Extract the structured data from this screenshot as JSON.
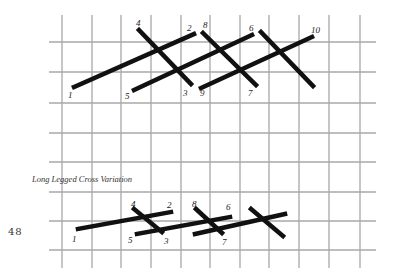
{
  "page_number": "48",
  "caption": "Long Legged Cross Variation",
  "colors": {
    "grid": "#a8a8a8",
    "stitch": "#111111",
    "text": "#222222"
  },
  "grid": {
    "vertical_x": [
      62,
      92,
      121,
      151,
      181,
      210,
      240,
      269,
      299,
      329,
      360
    ],
    "vertical_y_range": [
      15,
      268
    ],
    "horizontal_y": [
      42,
      72,
      103,
      133,
      162,
      192,
      221,
      250
    ],
    "horizontal_x_range": [
      49,
      376
    ]
  },
  "top_diagram": {
    "labels": [
      {
        "text": "1",
        "x": 68,
        "y": 91
      },
      {
        "text": "2",
        "x": 187,
        "y": 24
      },
      {
        "text": "3",
        "x": 183,
        "y": 89
      },
      {
        "text": "4",
        "x": 136,
        "y": 19
      },
      {
        "text": "5",
        "x": 125,
        "y": 92
      },
      {
        "text": "6",
        "x": 249,
        "y": 24
      },
      {
        "text": "7",
        "x": 248,
        "y": 89
      },
      {
        "text": "8",
        "x": 203,
        "y": 21
      },
      {
        "text": "9",
        "x": 200,
        "y": 89
      },
      {
        "text": "10",
        "x": 311,
        "y": 26
      }
    ],
    "stitches": [
      {
        "from": "1",
        "to": "2",
        "x1": 74,
        "y1": 87,
        "x2": 194,
        "y2": 34
      },
      {
        "from": "4",
        "to": "3",
        "x1": 139,
        "y1": 30,
        "x2": 191,
        "y2": 84
      },
      {
        "from": "5",
        "to": "6",
        "x1": 134,
        "y1": 90,
        "x2": 252,
        "y2": 35
      },
      {
        "from": "8",
        "to": "7",
        "x1": 203,
        "y1": 33,
        "x2": 256,
        "y2": 85
      },
      {
        "from": "9",
        "to": "10",
        "x1": 201,
        "y1": 88,
        "x2": 312,
        "y2": 37
      },
      {
        "from": "",
        "to": "",
        "x1": 261,
        "y1": 32,
        "x2": 313,
        "y2": 86
      }
    ]
  },
  "bottom_diagram": {
    "labels": [
      {
        "text": "1",
        "x": 72,
        "y": 235
      },
      {
        "text": "2",
        "x": 167,
        "y": 201
      },
      {
        "text": "3",
        "x": 164,
        "y": 237
      },
      {
        "text": "4",
        "x": 131,
        "y": 200
      },
      {
        "text": "5",
        "x": 128,
        "y": 236
      },
      {
        "text": "6",
        "x": 226,
        "y": 203
      },
      {
        "text": "7",
        "x": 222,
        "y": 238
      },
      {
        "text": "8",
        "x": 192,
        "y": 200
      }
    ],
    "stitches": [
      {
        "from": "1",
        "to": "2",
        "x1": 78,
        "y1": 229,
        "x2": 171,
        "y2": 212
      },
      {
        "from": "4",
        "to": "3",
        "x1": 134,
        "y1": 209,
        "x2": 162,
        "y2": 232
      },
      {
        "from": "5",
        "to": "6",
        "x1": 137,
        "y1": 234,
        "x2": 230,
        "y2": 217
      },
      {
        "from": "8",
        "to": "7",
        "x1": 196,
        "y1": 209,
        "x2": 222,
        "y2": 233
      },
      {
        "from": "",
        "to": "",
        "x1": 195,
        "y1": 234,
        "x2": 285,
        "y2": 214
      },
      {
        "from": "",
        "to": "",
        "x1": 251,
        "y1": 209,
        "x2": 283,
        "y2": 236
      }
    ]
  }
}
